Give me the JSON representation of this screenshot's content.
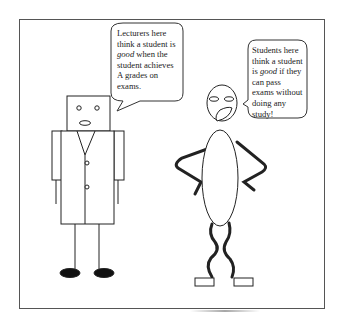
{
  "panel": {
    "description": "Cartoon comparing lecturer and student views of a good student"
  },
  "lecturer": {
    "label": "lecturer",
    "bubble": {
      "line1": "Lecturers here",
      "line2": "think a student is",
      "line3_italic": "good",
      "line3_rest": " when the",
      "line4": "student achieves",
      "line5": "A grades on",
      "line6": "exams."
    }
  },
  "student": {
    "label": "student",
    "bubble": {
      "line1": "Students here",
      "line2": "think a student",
      "line3_pre": "is ",
      "line3_italic": "good",
      "line3_rest": " if they",
      "line4": "can pass",
      "line5": "exams without",
      "line6": "doing any",
      "line7": "study!"
    }
  },
  "colors": {
    "line": "#222222",
    "frame": "#555555",
    "background": "#ffffff"
  }
}
